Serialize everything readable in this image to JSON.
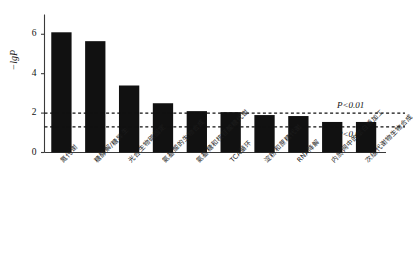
{
  "chart_data": {
    "type": "bar",
    "title": "",
    "subtitle": "",
    "xlabel": "",
    "ylabel": "−lgP",
    "ylim": [
      0,
      6.8
    ],
    "yticks": [
      0,
      2,
      4,
      6
    ],
    "ytick_labels": [
      "0",
      "2",
      "4",
      "6"
    ],
    "grid": false,
    "legend": null,
    "bar_color": "#111111",
    "categories": [
      "氮代谢",
      "糖酵解/糖异生",
      "光合生物碳固定",
      "氨基酸的生物合成",
      "氨基糖和核苷酸糖代谢",
      "TCA循环",
      "淀粉和蔗糖代谢",
      "RNA降解",
      "内质网中的蛋白质加工",
      "次级代谢物生物合成"
    ],
    "values": [
      6.1,
      5.65,
      3.4,
      2.5,
      2.1,
      2.05,
      1.9,
      1.85,
      1.55,
      1.55
    ],
    "annotations": [
      {
        "name": "p01-line",
        "label": "P<0.01",
        "y": 2.0,
        "style": "dashed"
      },
      {
        "name": "p05-line",
        "label": "P<0.05",
        "y": 1.3,
        "style": "dashed"
      }
    ]
  }
}
